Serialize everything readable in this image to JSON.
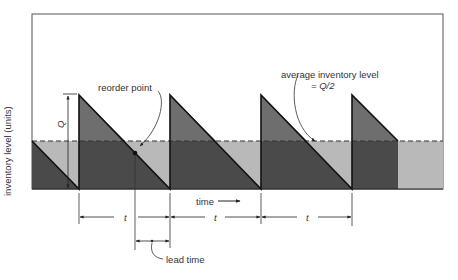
{
  "diagram": {
    "title": "",
    "y_axis_label": "inventory level (units)",
    "x_axis_label": "time",
    "labels": {
      "Q": "Q",
      "reorder_point": "reorder point",
      "average_level_line1": "average inventory level",
      "average_level_line2": "= Q/2",
      "cycle_1": "t",
      "cycle_2": "t",
      "cycle_3": "t",
      "lead_time": "lead time"
    },
    "colors": {
      "dark_fill": "#4a4a4a",
      "mid_fill": "#6e6e6e",
      "light_fill": "#b9b9b9",
      "line": "#111111",
      "frame": "#555555"
    }
  }
}
